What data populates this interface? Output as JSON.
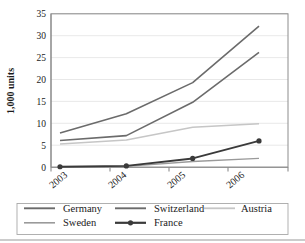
{
  "chart_data": {
    "type": "line",
    "title": "",
    "xlabel": "",
    "ylabel": "1,000 units",
    "categories": [
      "2003",
      "2004",
      "2005",
      "2006"
    ],
    "ylim": [
      0,
      35
    ],
    "ytick_labels": [
      "0",
      "5",
      "10",
      "15",
      "20",
      "25",
      "30",
      "35"
    ],
    "ytick_values": [
      0,
      5,
      10,
      15,
      20,
      25,
      30,
      35
    ],
    "grid": true,
    "legend_position": "bottom",
    "series": [
      {
        "name": "Germany",
        "values": [
          7.8,
          12.2,
          19.3,
          32.2
        ],
        "color": "#6b6b6b",
        "width": 1.6,
        "marker": "none"
      },
      {
        "name": "Switzerland",
        "values": [
          6.1,
          7.2,
          14.8,
          26.2
        ],
        "color": "#6b6b6b",
        "width": 1.6,
        "marker": "none"
      },
      {
        "name": "Austria",
        "values": [
          5.3,
          6.2,
          9.1,
          9.9
        ],
        "color": "#c6c6c6",
        "width": 1.5,
        "marker": "none"
      },
      {
        "name": "Sweden",
        "values": [
          0.1,
          0.2,
          1.3,
          2.0
        ],
        "color": "#9a9a9a",
        "width": 1.3,
        "marker": "none"
      },
      {
        "name": "France",
        "values": [
          0.1,
          0.3,
          2.0,
          6.0
        ],
        "color": "#3a3a3a",
        "width": 1.9,
        "marker": "circle"
      }
    ]
  },
  "legend": {
    "entries": [
      {
        "label": "Germany"
      },
      {
        "label": "Switzerland"
      },
      {
        "label": "Austria"
      },
      {
        "label": "Sweden"
      },
      {
        "label": "France"
      }
    ]
  }
}
